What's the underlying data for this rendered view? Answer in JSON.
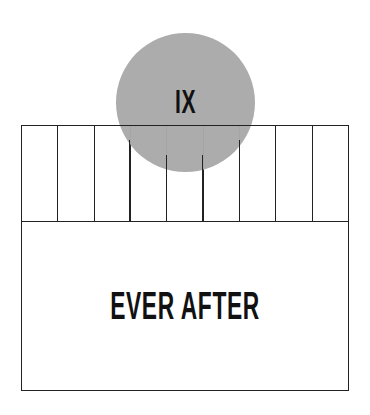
{
  "diagram": {
    "circle": {
      "label": "IX",
      "color": "#a9a9a9"
    },
    "strip": {
      "column_count": 9
    },
    "box": {
      "label": "EVER AFTER"
    },
    "line_color": "#222222"
  }
}
